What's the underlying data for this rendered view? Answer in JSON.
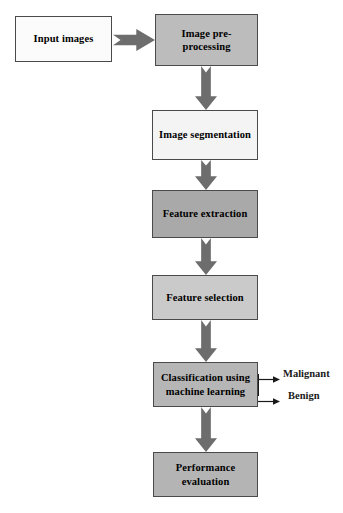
{
  "diagram": {
    "background_color": "#ffffff",
    "nodes": [
      {
        "id": "input-images",
        "label": "Input images",
        "fill": "#fbfbfb",
        "border": "#4a4a4a",
        "x": 15,
        "y": 16,
        "w": 97,
        "h": 46
      },
      {
        "id": "image-pre-processing",
        "label": "Image pre-\nprocessing",
        "fill": "#bcbcbc",
        "border": "#4a4a4a",
        "x": 155,
        "y": 14,
        "w": 103,
        "h": 52
      },
      {
        "id": "image-segmentation",
        "label": "Image segmentation",
        "fill": "#f4f4f4",
        "border": "#4a4a4a",
        "x": 152,
        "y": 110,
        "w": 106,
        "h": 50
      },
      {
        "id": "feature-extraction",
        "label": "Feature extraction",
        "fill": "#a9a9a9",
        "border": "#4a4a4a",
        "x": 152,
        "y": 190,
        "w": 106,
        "h": 48
      },
      {
        "id": "feature-selection",
        "label": "Feature selection",
        "fill": "#cacaca",
        "border": "#4a4a4a",
        "x": 152,
        "y": 275,
        "w": 106,
        "h": 45
      },
      {
        "id": "classification-using-machine-learning",
        "label": "Classification using\nmachine learning",
        "fill": "#b6b6b6",
        "border": "#4a4a4a",
        "x": 153,
        "y": 362,
        "w": 105,
        "h": 45
      },
      {
        "id": "performance-evaluation",
        "label": "Performance\nevaluation",
        "fill": "#b4b4b4",
        "border": "#4a4a4a",
        "x": 153,
        "y": 452,
        "w": 105,
        "h": 45
      }
    ],
    "block_arrows": [
      {
        "id": "input-to-preprocessing",
        "direction": "right",
        "color": "#6d6d6d",
        "x": 113,
        "y": 29,
        "w": 42,
        "h": 22
      },
      {
        "id": "preprocessing-to-segmentation",
        "direction": "down",
        "color": "#6d6d6d",
        "x": 195,
        "y": 66,
        "w": 22,
        "h": 44
      },
      {
        "id": "segmentation-to-extraction",
        "direction": "down",
        "color": "#6d6d6d",
        "x": 195,
        "y": 160,
        "w": 22,
        "h": 30
      },
      {
        "id": "extraction-to-selection",
        "direction": "down",
        "color": "#6d6d6d",
        "x": 195,
        "y": 238,
        "w": 22,
        "h": 37
      },
      {
        "id": "selection-to-classification",
        "direction": "down",
        "color": "#6d6d6d",
        "x": 195,
        "y": 320,
        "w": 22,
        "h": 42
      },
      {
        "id": "classification-to-performance",
        "direction": "down",
        "color": "#6d6d6d",
        "x": 195,
        "y": 407,
        "w": 22,
        "h": 45
      }
    ],
    "branches": [
      {
        "id": "malignant",
        "label": "Malignant",
        "color": "#1a1a1a",
        "line_x": 258,
        "line_y": 374,
        "line_w": 22,
        "label_x": 283,
        "label_y": 368
      },
      {
        "id": "benign",
        "label": "Benign",
        "color": "#1a1a1a",
        "line_x": 258,
        "line_y": 396,
        "line_w": 22,
        "label_x": 288,
        "label_y": 390
      }
    ]
  }
}
